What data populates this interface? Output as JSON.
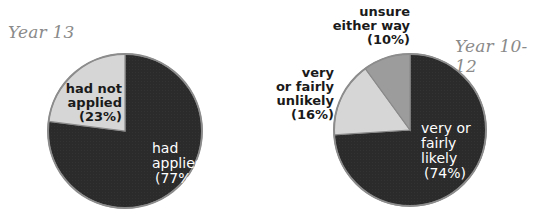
{
  "chart_data": [
    {
      "type": "pie",
      "title": "Year 13",
      "categories": [
        "had applied",
        "had not applied"
      ],
      "values": [
        77,
        23
      ],
      "unit": "%",
      "colors": [
        "#2b2b2b",
        "#d6d6d6"
      ],
      "labels": [
        {
          "lines": [
            "had",
            "applied",
            "(77%)"
          ]
        },
        {
          "lines": [
            "had not",
            "applied",
            "(23%)"
          ]
        }
      ]
    },
    {
      "type": "pie",
      "title": "Year 10-12",
      "categories": [
        "very or fairly likely",
        "very or fairly unlikely",
        "unsure either way"
      ],
      "values": [
        74,
        16,
        10
      ],
      "unit": "%",
      "colors": [
        "#2b2b2b",
        "#d6d6d6",
        "#9c9c9c"
      ],
      "labels": [
        {
          "lines": [
            "very or",
            "fairly",
            "likely",
            "(74%)"
          ]
        },
        {
          "lines": [
            "very",
            "or fairly",
            "unlikely",
            "(16%)"
          ]
        },
        {
          "lines": [
            "unsure",
            "either way",
            "(10%)"
          ]
        }
      ]
    }
  ]
}
